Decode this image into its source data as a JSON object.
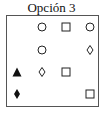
{
  "title": "Opción 3",
  "grid": {
    "columns_x": [
      17,
      42,
      66,
      90
    ],
    "rows_y": [
      27,
      50,
      72,
      94
    ],
    "cells": [
      {
        "row": 0,
        "col": 1,
        "shape": "circle-outline-icon"
      },
      {
        "row": 0,
        "col": 2,
        "shape": "square-outline-icon"
      },
      {
        "row": 0,
        "col": 3,
        "shape": "circle-outline-icon"
      },
      {
        "row": 1,
        "col": 1,
        "shape": "circle-outline-icon"
      },
      {
        "row": 1,
        "col": 3,
        "shape": "diamond-outline-icon"
      },
      {
        "row": 2,
        "col": 0,
        "shape": "triangle-filled-icon"
      },
      {
        "row": 2,
        "col": 1,
        "shape": "diamond-outline-icon"
      },
      {
        "row": 2,
        "col": 2,
        "shape": "square-outline-icon"
      },
      {
        "row": 3,
        "col": 0,
        "shape": "diamond-filled-icon"
      },
      {
        "row": 3,
        "col": 3,
        "shape": "square-outline-icon"
      }
    ]
  },
  "colors": {
    "stroke": "#222222",
    "fill": "#111111",
    "border": "#555555"
  }
}
